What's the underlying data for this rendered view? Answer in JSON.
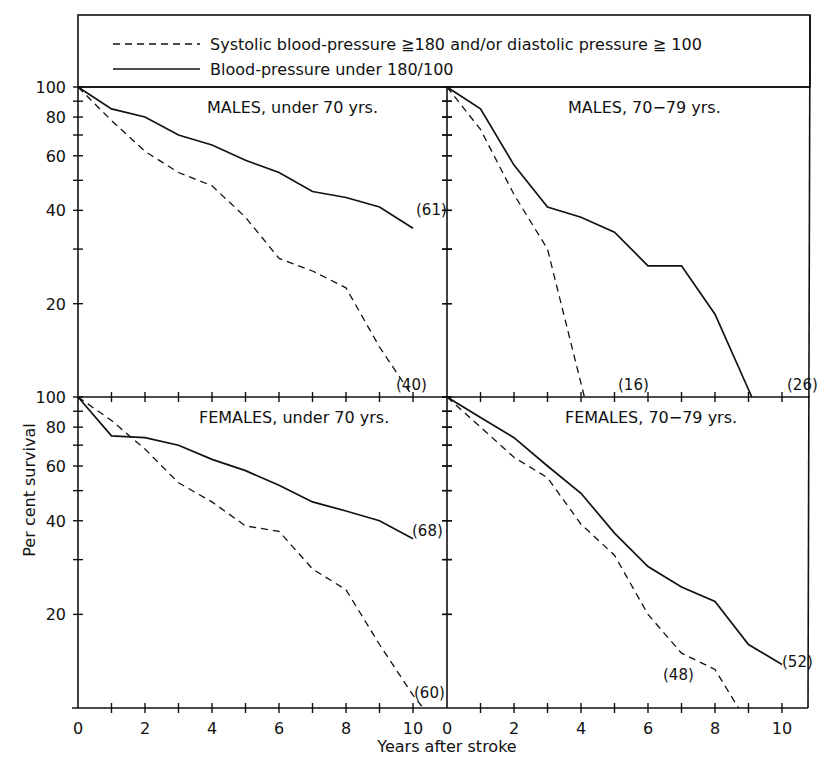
{
  "legend": {
    "dashed_label": "Systolic  blood-pressure ≧180  and/or  diastolic  pressure ≧ 100",
    "solid_label": "Blood-pressure  under  180/100"
  },
  "axes": {
    "ylabel": "Per  cent  survival",
    "xlabel": "Years  after  stroke",
    "y_ticks_labeled": [
      "100",
      "80",
      "60",
      "40",
      "20"
    ],
    "x_tick_labels": [
      "0",
      "2",
      "4",
      "6",
      "8",
      "10"
    ]
  },
  "chart_data": [
    {
      "type": "line",
      "title": "MALES, under 70 yrs.",
      "xlabel": "Years after stroke",
      "ylabel": "Per cent survival",
      "yscale": "log",
      "ylim": [
        10,
        100
      ],
      "xlim": [
        0,
        10.5
      ],
      "series": [
        {
          "name": "Blood-pressure under 180/100",
          "style": "solid",
          "n_label": "(61)",
          "x": [
            0,
            1,
            2,
            3,
            4,
            5,
            6,
            7,
            8,
            9,
            10
          ],
          "values": [
            100,
            85,
            80,
            70,
            65,
            58,
            53,
            46,
            44,
            41,
            35
          ]
        },
        {
          "name": "Systolic blood-pressure ≧180 and/or diastolic pressure ≧100",
          "style": "dashed",
          "n_label": "(40)",
          "x": [
            0,
            1,
            2,
            3,
            4,
            5,
            6,
            7,
            8,
            9,
            10
          ],
          "values": [
            100,
            78,
            62,
            53,
            48,
            38,
            28,
            25.5,
            22.5,
            14.5,
            10
          ]
        }
      ]
    },
    {
      "type": "line",
      "title": "MALES, 70−79 yrs.",
      "xlabel": "Years after stroke",
      "ylabel": "Per cent survival",
      "yscale": "log",
      "ylim": [
        10,
        100
      ],
      "xlim": [
        0,
        10.5
      ],
      "series": [
        {
          "name": "Blood-pressure under 180/100",
          "style": "solid",
          "n_label": "(26)",
          "x": [
            0,
            1,
            2,
            3,
            4,
            5,
            6,
            7,
            8,
            9.1
          ],
          "values": [
            100,
            85,
            56,
            41,
            38,
            34,
            26.5,
            26.5,
            18.5,
            10
          ]
        },
        {
          "name": "Systolic blood-pressure ≧180 and/or diastolic pressure ≧100",
          "style": "dashed",
          "n_label": "(16)",
          "x": [
            0,
            1,
            2,
            3,
            4.1
          ],
          "values": [
            100,
            73,
            45,
            30,
            10
          ]
        }
      ]
    },
    {
      "type": "line",
      "title": "FEMALES, under 70 yrs.",
      "xlabel": "Years after stroke",
      "ylabel": "Per cent survival",
      "yscale": "log",
      "ylim": [
        10,
        100
      ],
      "xlim": [
        0,
        10.5
      ],
      "series": [
        {
          "name": "Blood-pressure under 180/100",
          "style": "solid",
          "n_label": "(68)",
          "x": [
            0,
            1,
            2,
            3,
            4,
            5,
            6,
            7,
            8,
            9,
            10
          ],
          "values": [
            100,
            75,
            74,
            70,
            63,
            58,
            52,
            46,
            43,
            40,
            35
          ]
        },
        {
          "name": "Systolic blood-pressure ≧180 and/or diastolic pressure ≧100",
          "style": "dashed",
          "n_label": "(60)",
          "x": [
            0,
            1,
            2,
            3,
            4,
            5,
            6,
            7,
            8,
            9,
            10,
            10.3
          ],
          "values": [
            100,
            84,
            68,
            53,
            46,
            38.5,
            37,
            28,
            24,
            16,
            11,
            10
          ]
        }
      ]
    },
    {
      "type": "line",
      "title": "FEMALES, 70−79 yrs.",
      "xlabel": "Years after stroke",
      "ylabel": "Per cent survival",
      "yscale": "log",
      "ylim": [
        10,
        100
      ],
      "xlim": [
        0,
        10.5
      ],
      "series": [
        {
          "name": "Blood-pressure under 180/100",
          "style": "solid",
          "n_label": "(52)",
          "x": [
            0,
            1,
            2,
            3,
            4,
            5,
            6,
            7,
            8,
            9,
            10
          ],
          "values": [
            100,
            86,
            74,
            60,
            49,
            36.5,
            28.5,
            24.5,
            22,
            16,
            13.8
          ]
        },
        {
          "name": "Systolic blood-pressure ≧180 and/or diastolic pressure ≧100",
          "style": "dashed",
          "n_label": "(48)",
          "x": [
            0,
            1,
            2,
            3,
            4,
            5,
            6,
            7,
            8,
            8.7
          ],
          "values": [
            100,
            80,
            64,
            55,
            39,
            31,
            20,
            15,
            13.3,
            10
          ]
        }
      ]
    }
  ]
}
